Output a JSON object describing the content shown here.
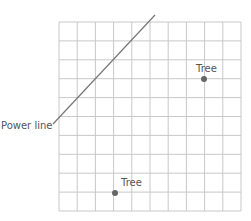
{
  "diagram": {
    "type": "grid-map",
    "grid": {
      "cols": 10,
      "rows": 10,
      "left": 59,
      "top": 22,
      "right": 241,
      "bottom": 211,
      "color": "#c8c8c8"
    },
    "power_line": {
      "label": "Power line",
      "x1": 53,
      "y1": 124,
      "x2": 155,
      "y2": 15,
      "color": "#777777"
    },
    "trees": [
      {
        "label": "Tree",
        "x": 204,
        "y": 79
      },
      {
        "label": "Tree",
        "x": 115,
        "y": 193
      }
    ],
    "point_color": "#666666"
  }
}
